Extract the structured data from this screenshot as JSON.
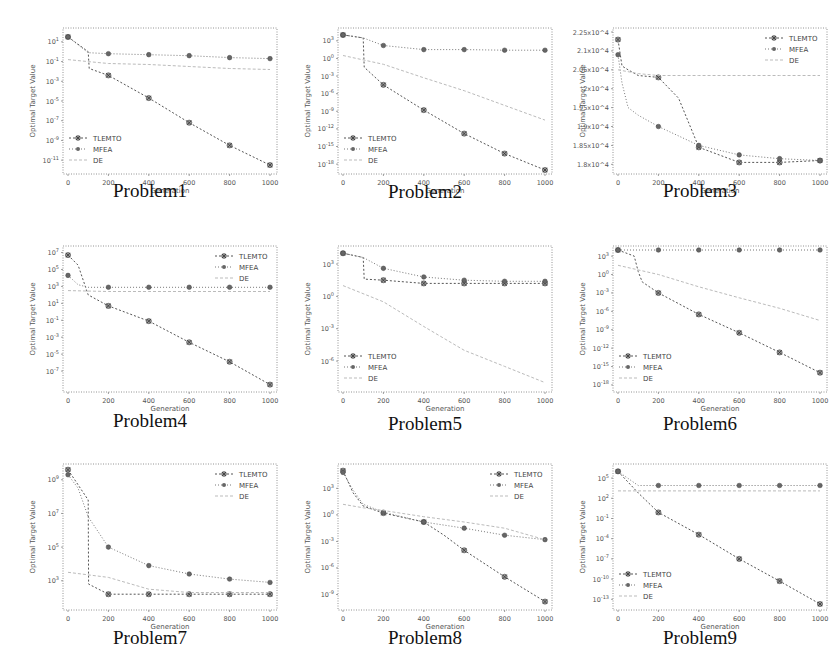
{
  "figure": {
    "legend": [
      "TLEMTO",
      "MFEA",
      "DE"
    ],
    "xlabel": "Generation",
    "ylabel": "Optimal Target Value"
  },
  "captions": [
    "Problem1",
    "Problem2",
    "Problem3",
    "Problem4",
    "Problem5",
    "Problem6",
    "Problem7",
    "Problem8",
    "Problem9"
  ],
  "chart_data": [
    {
      "type": "line",
      "title": "Problem1",
      "xlabel": "Generation",
      "ylabel": "Optimal Target Value",
      "yscale": "log",
      "x_ticks": [
        0,
        200,
        400,
        600,
        800,
        1000
      ],
      "y_ticks": [
        "10^1",
        "10^-1",
        "10^-3",
        "10^-5",
        "10^-7",
        "10^-9",
        "10^-11"
      ],
      "y_tick_exp": [
        1,
        -1,
        -3,
        -5,
        -7,
        -9,
        -11
      ],
      "ylim_exp": [
        -12,
        2
      ],
      "legend_position": "lower left",
      "series": [
        {
          "name": "TLEMTO",
          "x": [
            0,
            100,
            105,
            200,
            400,
            600,
            800,
            1000
          ],
          "y_exp": [
            1.5,
            0.0,
            -1.7,
            -2.4,
            -4.7,
            -7.2,
            -9.5,
            -11.5
          ]
        },
        {
          "name": "MFEA",
          "x": [
            0,
            100,
            200,
            400,
            600,
            800,
            1000
          ],
          "y_exp": [
            1.5,
            -0.1,
            -0.2,
            -0.3,
            -0.4,
            -0.6,
            -0.7
          ]
        },
        {
          "name": "DE",
          "x": [
            0,
            100,
            200,
            400,
            600,
            800,
            1000
          ],
          "y_exp": [
            -0.8,
            -1.0,
            -1.2,
            -1.3,
            -1.5,
            -1.7,
            -1.8
          ]
        }
      ]
    },
    {
      "type": "line",
      "title": "Problem2",
      "xlabel": "Generation",
      "ylabel": "Optimal Target Value",
      "yscale": "log",
      "x_ticks": [
        0,
        200,
        400,
        600,
        800,
        1000
      ],
      "y_ticks": [
        "10^3",
        "10^0",
        "10^-3",
        "10^-6",
        "10^-9",
        "10^-12",
        "10^-15",
        "10^-18"
      ],
      "y_tick_exp": [
        3,
        0,
        -3,
        -6,
        -9,
        -12,
        -15,
        -18
      ],
      "ylim_exp": [
        -19,
        4.5
      ],
      "legend_position": "lower left",
      "series": [
        {
          "name": "TLEMTO",
          "x": [
            0,
            100,
            105,
            200,
            400,
            600,
            800,
            1000
          ],
          "y_exp": [
            4,
            3.5,
            -1.5,
            -4.5,
            -8.8,
            -12.8,
            -16.2,
            -19
          ]
        },
        {
          "name": "MFEA",
          "x": [
            0,
            100,
            200,
            400,
            600,
            800,
            1000
          ],
          "y_exp": [
            4,
            3.5,
            2.2,
            1.5,
            1.5,
            1.4,
            1.4
          ]
        },
        {
          "name": "DE",
          "x": [
            0,
            200,
            400,
            600,
            800,
            1000
          ],
          "y_exp": [
            0.5,
            -1.0,
            -3.3,
            -5.5,
            -8.0,
            -10.5
          ]
        }
      ]
    },
    {
      "type": "line",
      "title": "Problem3",
      "xlabel": "Generation",
      "ylabel": "Optimal Target Value",
      "yscale": "log",
      "x_ticks": [
        0,
        200,
        400,
        600,
        800,
        1000
      ],
      "y_ticks": [
        "2.25x10^4",
        "2.1x10^4",
        "2.05x10^4",
        "2x10^4",
        "1.95x10^4",
        "1.9x10^4",
        "1.85x10^4",
        "1.8x10^4"
      ],
      "y_tick_exp": [
        7,
        6,
        5,
        4,
        3,
        2,
        1,
        0
      ],
      "ylim_exp": [
        -0.3,
        7
      ],
      "legend_position": "upper right",
      "series": [
        {
          "name": "TLEMTO",
          "x": [
            0,
            20,
            50,
            100,
            200,
            300,
            400,
            600,
            800,
            1000
          ],
          "y_exp": [
            6.6,
            5.2,
            5.0,
            4.7,
            4.6,
            3.5,
            0.9,
            0.1,
            0.1,
            0.2
          ]
        },
        {
          "name": "MFEA",
          "x": [
            0,
            20,
            50,
            100,
            200,
            400,
            600,
            800,
            1000
          ],
          "y_exp": [
            5.8,
            4.3,
            3.0,
            2.6,
            2.0,
            1.0,
            0.5,
            0.3,
            0.2
          ]
        },
        {
          "name": "DE",
          "x": [
            0,
            100,
            200,
            400,
            600,
            800,
            1000
          ],
          "y_exp": [
            5.0,
            4.8,
            4.7,
            4.7,
            4.7,
            4.7,
            4.7
          ]
        }
      ]
    },
    {
      "type": "line",
      "title": "Problem4",
      "xlabel": "Generation",
      "ylabel": "Optimal Target Value",
      "yscale": "log",
      "x_ticks": [
        0,
        200,
        400,
        600,
        800,
        1000
      ],
      "y_ticks": [
        "10^7",
        "10^5",
        "10^3",
        "10^1",
        "10^-1",
        "10^-3",
        "10^-5",
        "10^-7"
      ],
      "y_tick_exp": [
        7,
        5,
        3,
        1,
        -1,
        -3,
        -5,
        -7
      ],
      "ylim_exp": [
        -9,
        7.3
      ],
      "legend_position": "upper right",
      "series": [
        {
          "name": "TLEMTO",
          "x": [
            0,
            50,
            100,
            200,
            400,
            600,
            800,
            1000
          ],
          "y_exp": [
            6.7,
            5.5,
            2.0,
            0.7,
            -1.1,
            -3.6,
            -5.9,
            -8.6
          ]
        },
        {
          "name": "MFEA",
          "x": [
            0,
            50,
            100,
            200,
            400,
            600,
            800,
            1000
          ],
          "y_exp": [
            4.3,
            3.2,
            2.9,
            2.9,
            2.9,
            2.9,
            2.9,
            2.9
          ]
        },
        {
          "name": "DE",
          "x": [
            0,
            200,
            400,
            600,
            800,
            1000
          ],
          "y_exp": [
            2.5,
            2.4,
            2.4,
            2.4,
            2.4,
            2.4
          ]
        }
      ]
    },
    {
      "type": "line",
      "title": "Problem5",
      "xlabel": "Generation",
      "ylabel": "Optimal Target Value",
      "yscale": "log",
      "x_ticks": [
        0,
        200,
        400,
        600,
        800,
        1000
      ],
      "y_ticks": [
        "10^3",
        "10^0",
        "10^-3",
        "10^-6"
      ],
      "y_tick_exp": [
        3,
        0,
        -3,
        -6
      ],
      "ylim_exp": [
        -8.5,
        4.3
      ],
      "legend_position": "lower left",
      "series": [
        {
          "name": "TLEMTO",
          "x": [
            0,
            100,
            105,
            200,
            400,
            600,
            800,
            1000
          ],
          "y_exp": [
            4,
            3.6,
            1.6,
            1.5,
            1.2,
            1.2,
            1.2,
            1.2
          ]
        },
        {
          "name": "MFEA",
          "x": [
            0,
            100,
            200,
            400,
            600,
            800,
            1000
          ],
          "y_exp": [
            4,
            3.6,
            2.6,
            1.8,
            1.5,
            1.4,
            1.4
          ]
        },
        {
          "name": "DE",
          "x": [
            0,
            200,
            400,
            600,
            800,
            1000
          ],
          "y_exp": [
            1.0,
            -0.5,
            -2.8,
            -5.0,
            -6.5,
            -8.0
          ]
        }
      ]
    },
    {
      "type": "line",
      "title": "Problem6",
      "xlabel": "Generation",
      "ylabel": "Optimal Target Value",
      "yscale": "log",
      "x_ticks": [
        0,
        200,
        400,
        600,
        800,
        1000
      ],
      "y_ticks": [
        "10^3",
        "10^0",
        "10^-3",
        "10^-6",
        "10^-9",
        "10^-12",
        "10^-15",
        "10^-18"
      ],
      "y_tick_exp": [
        3,
        0,
        -3,
        -6,
        -9,
        -12,
        -15,
        -18
      ],
      "ylim_exp": [
        -18.5,
        4
      ],
      "legend_position": "lower left",
      "series": [
        {
          "name": "TLEMTO",
          "x": [
            0,
            80,
            100,
            120,
            200,
            400,
            600,
            800,
            1000
          ],
          "y_exp": [
            4,
            3.0,
            0.5,
            -1.2,
            -3.0,
            -6.5,
            -9.5,
            -12.7,
            -16.0
          ]
        },
        {
          "name": "MFEA",
          "x": [
            0,
            200,
            400,
            600,
            800,
            1000
          ],
          "y_exp": [
            4,
            4,
            4,
            4,
            4,
            4
          ]
        },
        {
          "name": "DE",
          "x": [
            0,
            200,
            400,
            600,
            800,
            1000
          ],
          "y_exp": [
            1.5,
            0.0,
            -2.0,
            -3.8,
            -5.5,
            -7.5
          ]
        }
      ]
    },
    {
      "type": "line",
      "title": "Problem7",
      "xlabel": "Generation",
      "ylabel": "Optimal Target Value",
      "yscale": "log",
      "x_ticks": [
        0,
        200,
        400,
        600,
        800,
        1000
      ],
      "x_tick_labels": [
        "0",
        "200",
        "400",
        "600",
        "800",
        "1000"
      ],
      "y_ticks": [
        "10^9",
        "10^7",
        "10^5",
        "10^3"
      ],
      "y_tick_exp": [
        9,
        7,
        5,
        3
      ],
      "ylim_exp": [
        1.5,
        9.7
      ],
      "legend_position": "upper right",
      "series": [
        {
          "name": "TLEMTO",
          "x": [
            0,
            100,
            102,
            200,
            400,
            600,
            800,
            1000
          ],
          "y_exp": [
            9.6,
            7.8,
            2.8,
            2.2,
            2.2,
            2.2,
            2.2,
            2.2
          ]
        },
        {
          "name": "MFEA",
          "x": [
            0,
            50,
            100,
            200,
            400,
            600,
            800,
            1000
          ],
          "y_exp": [
            9.3,
            8.5,
            6.8,
            5.0,
            3.9,
            3.4,
            3.1,
            2.9
          ]
        },
        {
          "name": "DE",
          "x": [
            0,
            200,
            400,
            600,
            800,
            1000
          ],
          "y_exp": [
            3.5,
            3.2,
            2.5,
            2.3,
            2.3,
            2.3
          ]
        }
      ]
    },
    {
      "type": "line",
      "title": "Problem8",
      "xlabel": "Generation",
      "ylabel": "Optimal Target Value",
      "yscale": "log",
      "x_ticks": [
        0,
        200,
        400,
        600,
        800,
        1000
      ],
      "y_ticks": [
        "10^3",
        "10^0",
        "10^-3",
        "10^-6",
        "10^-9"
      ],
      "y_tick_exp": [
        3,
        0,
        -3,
        -6,
        -9
      ],
      "ylim_exp": [
        -10.3,
        5.3
      ],
      "legend_position": "upper right",
      "series": [
        {
          "name": "TLEMTO",
          "x": [
            0,
            50,
            100,
            200,
            400,
            500,
            600,
            800,
            1000
          ],
          "y_exp": [
            5,
            2.5,
            1.0,
            0.2,
            -0.8,
            -2.3,
            -4.0,
            -7.0,
            -9.8
          ]
        },
        {
          "name": "MFEA",
          "x": [
            0,
            50,
            100,
            200,
            400,
            600,
            800,
            1000
          ],
          "y_exp": [
            4.8,
            2.8,
            1.2,
            0.3,
            -0.8,
            -1.5,
            -2.3,
            -2.8
          ]
        },
        {
          "name": "DE",
          "x": [
            0,
            100,
            200,
            400,
            600,
            800,
            1000
          ],
          "y_exp": [
            1.2,
            0.8,
            0.5,
            -0.2,
            -0.8,
            -1.5,
            -2.8
          ]
        }
      ]
    },
    {
      "type": "line",
      "title": "Problem9",
      "xlabel": "Generation",
      "ylabel": "Optimal Target Value",
      "yscale": "log",
      "x_ticks": [
        0,
        200,
        400,
        600,
        800,
        1000
      ],
      "y_ticks": [
        "10^5",
        "10^2",
        "10^-1",
        "10^-4",
        "10^-7",
        "10^-10",
        "10^-13"
      ],
      "y_tick_exp": [
        5,
        2,
        -1,
        -4,
        -7,
        -10,
        -13
      ],
      "ylim_exp": [
        -14,
        6.5
      ],
      "legend_position": "lower left",
      "series": [
        {
          "name": "TLEMTO",
          "x": [
            0,
            100,
            200,
            400,
            600,
            800,
            1000
          ],
          "y_exp": [
            6,
            2.8,
            -0.1,
            -3.4,
            -7.0,
            -10.3,
            -13.7
          ]
        },
        {
          "name": "MFEA",
          "x": [
            0,
            100,
            200,
            400,
            600,
            800,
            1000
          ],
          "y_exp": [
            6,
            3.9,
            3.9,
            3.9,
            3.9,
            3.9,
            3.9
          ]
        },
        {
          "name": "DE",
          "x": [
            0,
            200,
            400,
            600,
            800,
            1000
          ],
          "y_exp": [
            3.1,
            3.1,
            3.1,
            3.1,
            3.1,
            3.1
          ]
        }
      ]
    }
  ],
  "layout": {
    "panel_origins": [
      [
        15,
        2
      ],
      [
        290,
        2
      ],
      [
        565,
        2
      ],
      [
        15,
        220
      ],
      [
        290,
        220
      ],
      [
        565,
        220
      ],
      [
        15,
        438
      ],
      [
        290,
        438
      ],
      [
        565,
        438
      ]
    ],
    "caption_tops": [
      180,
      181,
      180,
      410,
      413,
      413,
      627,
      627,
      627
    ]
  }
}
